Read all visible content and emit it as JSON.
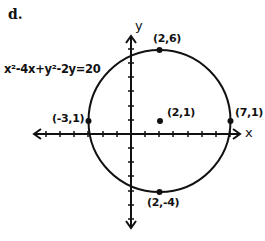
{
  "part_label": "d.",
  "equation": "x²-4x+y²-2y=20",
  "axes": {
    "x_label": "x",
    "y_label": "y"
  },
  "points": [
    {
      "label": "(2,6)",
      "x": 2,
      "y": 6
    },
    {
      "label": "(-3,1)",
      "x": -3,
      "y": 1
    },
    {
      "label": "(2,1)",
      "x": 2,
      "y": 1
    },
    {
      "label": "(7,1)",
      "x": 7,
      "y": 1
    },
    {
      "label": "(2,-4)",
      "x": 2,
      "y": -4
    }
  ],
  "circle": {
    "center": [
      2,
      1
    ],
    "radius": 5
  },
  "colors": {
    "ink": "#111111",
    "background": "#ffffff"
  }
}
